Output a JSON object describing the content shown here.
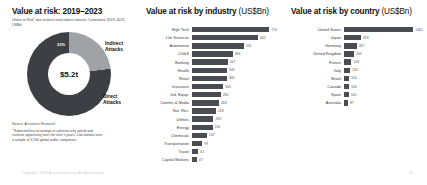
{
  "donut_panel": {
    "title": "Value at risk: 2019–2023",
    "subtitle": "(Value at Risk* due to direct and indirect attacks. Cumulative 2019–2023, US$b)",
    "center_value": "$5.2t",
    "indirect_label": "Indirect Attacks",
    "direct_label": "Direct Attacks",
    "indirect_pct_label": "23%",
    "direct_pct_label": "77%",
    "colors": {
      "indirect": "#a0a2a6",
      "direct": "#3d3f44"
    },
    "source": "Source: Accenture Research",
    "footnote": "* Expected loss of savings in cybersecurity spend and revenue opportunity over the next 5 years. Calculations over a sample of 4,700 global public companies."
  },
  "industry_panel": {
    "title": "Value at risk by industry",
    "title_unit": " (US$Bn)"
  },
  "country_panel": {
    "title": "Value at risk by country",
    "title_unit": " (US$Bn)"
  },
  "footer": {
    "copyright": "Copyright © 2019 Accenture Security. All rights reserved.",
    "page_number": "10"
  },
  "chart_data": [
    {
      "type": "pie",
      "title": "Value at risk: 2019–2023",
      "subtitle": "Value at Risk due to direct and indirect attacks. Cumulative 2019–2023, US$b",
      "total": "$5.2t",
      "categories": [
        "Indirect Attacks",
        "Direct Attacks"
      ],
      "values": [
        23,
        77
      ],
      "value_unit": "percent",
      "legend": "labels placed beside slices"
    },
    {
      "type": "bar",
      "orientation": "horizontal",
      "title": "Value at risk by industry (US$Bn)",
      "xlabel": "US$Bn",
      "ylabel": "",
      "grid": false,
      "xlim": [
        0,
        760
      ],
      "categories": [
        "High Tech",
        "Life Sciences",
        "Automotive",
        "CG&S",
        "Banking",
        "Health",
        "Retail",
        "Insurance",
        "Ind. Equip.",
        "Comms & Media",
        "Nat. Res.",
        "Utilities",
        "Energy",
        "Chemicals",
        "Transportation",
        "Travel",
        "Capital Markets"
      ],
      "values": [
        753,
        642,
        505,
        396,
        347,
        342,
        340,
        305,
        280,
        263,
        233,
        209,
        200,
        147,
        99,
        61,
        47
      ]
    },
    {
      "type": "bar",
      "orientation": "horizontal",
      "title": "Value at risk by country (US$Bn)",
      "xlabel": "US$Bn",
      "ylabel": "",
      "grid": false,
      "xlim": [
        0,
        1500
      ],
      "categories": [
        "United States",
        "Japan",
        "Germany",
        "United Kingdom",
        "France",
        "Italy",
        "Brazil",
        "Canada",
        "Spain",
        "Australia"
      ],
      "values": [
        1465,
        358,
        267,
        209,
        158,
        131,
        104,
        104,
        100,
        87
      ]
    }
  ]
}
